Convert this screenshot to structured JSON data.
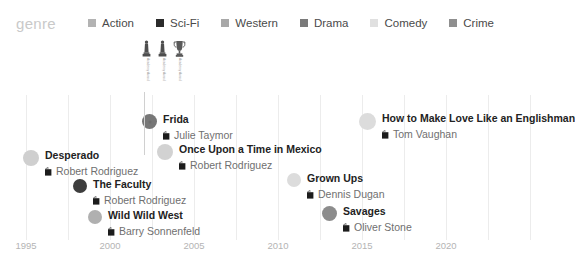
{
  "legend": {
    "title": "genre",
    "items": [
      {
        "label": "Action",
        "color": "#b3b3b3",
        "icon": "legend-swatch-action"
      },
      {
        "label": "Sci-Fi",
        "color": "#2b2b2b",
        "icon": "legend-swatch-sci-fi"
      },
      {
        "label": "Western",
        "color": "#a8a8a8",
        "icon": "legend-swatch-western"
      },
      {
        "label": "Drama",
        "color": "#7a7a7a",
        "icon": "legend-swatch-drama"
      },
      {
        "label": "Comedy",
        "color": "#e0e0e0",
        "icon": "legend-swatch-comedy"
      },
      {
        "label": "Crime",
        "color": "#8f8f8f",
        "icon": "legend-swatch-crime"
      }
    ]
  },
  "axis": {
    "ticks": [
      "1995",
      "2000",
      "2005",
      "2010",
      "2015",
      "2020"
    ],
    "tick_x": [
      26,
      110,
      194,
      278,
      362,
      446
    ]
  },
  "gridlines_x": [
    26,
    68,
    110,
    152,
    194,
    236,
    278,
    320,
    362,
    404,
    446,
    488,
    530
  ],
  "awards": {
    "items": [
      {
        "icon": "award-statuette-icon",
        "label": "Academy Award",
        "x": 0
      },
      {
        "icon": "award-statuette-icon",
        "label": "Academy Award",
        "x": 16
      },
      {
        "icon": "award-trophy-icon",
        "label": "Academy Award",
        "x": 32
      }
    ]
  },
  "chart_data": {
    "type": "scatter",
    "title": "genre",
    "xlabel": "",
    "ylabel": "",
    "xlim": [
      1994,
      2022
    ],
    "grid": true,
    "legend_position": "top",
    "categories": [
      "Action",
      "Sci-Fi",
      "Western",
      "Drama",
      "Comedy",
      "Crime"
    ],
    "points": [
      {
        "title": "Desperado",
        "director": "Robert Rodriguez",
        "genre": "Action",
        "color": "#cfcfcf",
        "year": 1995,
        "x": 23,
        "y": 55,
        "dot_size": 16,
        "awards": 0
      },
      {
        "title": "The Faculty",
        "director": "Robert Rodriguez",
        "genre": "Sci-Fi",
        "color": "#3d3d3d",
        "year": 1998,
        "x": 73,
        "y": 84,
        "dot_size": 14,
        "awards": 0
      },
      {
        "title": "Wild Wild West",
        "director": "Barry Sonnenfeld",
        "genre": "Western",
        "color": "#b0b0b0",
        "year": 1999,
        "x": 88,
        "y": 115,
        "dot_size": 14,
        "awards": 0
      },
      {
        "title": "Frida",
        "director": "Julie Taymor",
        "genre": "Drama",
        "color": "#777777",
        "year": 2002,
        "x": 142,
        "y": 19,
        "dot_size": 15,
        "awards": 3
      },
      {
        "title": "Once Upon a Time in Mexico",
        "director": "Robert Rodriguez",
        "genre": "Action",
        "color": "#d2d2d2",
        "year": 2003,
        "x": 157,
        "y": 49,
        "dot_size": 16,
        "awards": 0
      },
      {
        "title": "Grown Ups",
        "director": "Dennis Dugan",
        "genre": "Comedy",
        "color": "#dcdcdc",
        "year": 2010,
        "x": 287,
        "y": 78,
        "dot_size": 14,
        "awards": 0
      },
      {
        "title": "Savages",
        "director": "Oliver Stone",
        "genre": "Crime",
        "color": "#8c8c8c",
        "year": 2012,
        "x": 322,
        "y": 111,
        "dot_size": 15,
        "awards": 0
      },
      {
        "title": "How to Make Love Like an Englishman",
        "director": "Tom Vaughan",
        "genre": "Comedy",
        "color": "#dcdcdc",
        "year": 2014,
        "x": 359,
        "y": 18,
        "dot_size": 17,
        "awards": 0
      }
    ]
  }
}
